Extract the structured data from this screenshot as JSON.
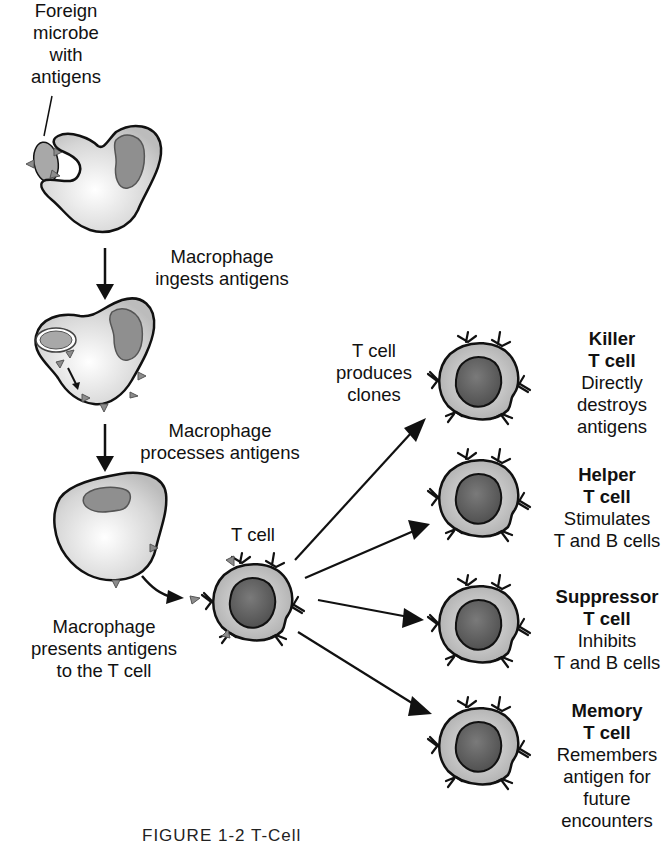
{
  "diagram": {
    "colors": {
      "outline": "#111111",
      "macrophage_fill": "#d9d9d9",
      "macrophage_nucleus": "#8a8a8a",
      "tcell_cytoplasm": "#bdbdbd",
      "tcell_nucleus": "#5e5e5e",
      "antigen": "#8c8c8c",
      "arrow": "#111111"
    },
    "labels": {
      "foreign_microbe": [
        "Foreign",
        "microbe",
        "with",
        "antigens"
      ],
      "step1": [
        "Macrophage",
        "ingests antigens"
      ],
      "step2": [
        "Macrophage",
        "processes antigens"
      ],
      "step3": [
        "Macrophage",
        "presents antigens",
        "to the T cell"
      ],
      "t_cell": "T cell",
      "clones": [
        "T cell",
        "produces",
        "clones"
      ]
    },
    "t_cell_types": [
      {
        "name": "Killer",
        "suffix": "T cell",
        "description": [
          "Directly",
          "destroys",
          "antigens"
        ]
      },
      {
        "name": "Helper",
        "suffix": "T cell",
        "description": [
          "Stimulates",
          "T and B cells"
        ]
      },
      {
        "name": "Suppressor",
        "suffix": "T cell",
        "description": [
          "Inhibits",
          "T and B cells"
        ]
      },
      {
        "name": "Memory",
        "suffix": "T cell",
        "description": [
          "Remembers",
          "antigen for",
          "future",
          "encounters"
        ]
      }
    ],
    "caption": "FIGURE 1-2   T-Cell"
  }
}
